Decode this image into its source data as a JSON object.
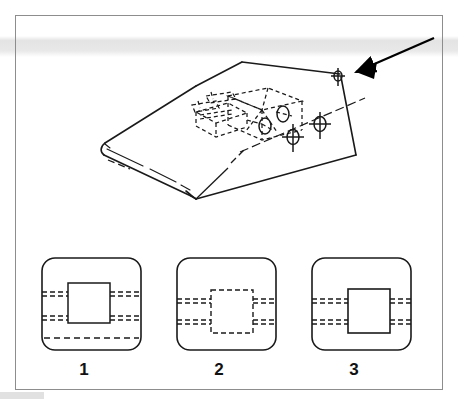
{
  "figure": {
    "type": "technical-drawing-multiple-choice",
    "frame": {
      "border_color": "#8d8d8d",
      "background_color": "#ffffff"
    },
    "artifact": {
      "name": "scanner-band",
      "color": "#e4e4e4"
    },
    "main_drawing": {
      "name": "isometric-wedge-block",
      "description": "Isometric wedge / ramp shaped solid with rounded leading edge",
      "line_color": "#1a1a1a",
      "hidden_detail": {
        "name": "hidden-internal-assembly",
        "style": "dashed",
        "description": "Hidden rectangular box with cylindrical bores shown in dashed lines"
      },
      "crosshair_markers": [
        {
          "name": "crosshair-marker-1"
        },
        {
          "name": "crosshair-marker-2"
        },
        {
          "name": "crosshair-marker-3"
        }
      ],
      "circles": [
        {
          "name": "bore-circle-1"
        },
        {
          "name": "bore-circle-2"
        }
      ],
      "arrow": {
        "name": "view-direction-arrow",
        "color": "#000000",
        "points_to": "top-right-corner-vertex"
      },
      "leader_lines": [
        {
          "name": "leader-line-to-front-corner"
        },
        {
          "name": "leader-line-to-right-edge"
        }
      ]
    },
    "options": [
      {
        "id": "1",
        "label": "1",
        "name": "option-panel-1",
        "square_style": "solid",
        "dashed_line_pairs": 2,
        "extra_lower_dashed_line": true
      },
      {
        "id": "2",
        "label": "2",
        "name": "option-panel-2",
        "square_style": "dashed",
        "dashed_line_pairs": 2,
        "extra_lower_dashed_line": false
      },
      {
        "id": "3",
        "label": "3",
        "name": "option-panel-3",
        "square_style": "solid",
        "dashed_line_pairs": 2,
        "extra_lower_dashed_line": false
      }
    ]
  }
}
